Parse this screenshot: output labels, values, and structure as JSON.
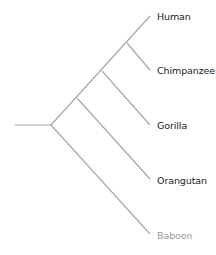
{
  "diagram": {
    "type": "phylogenetic-tree",
    "line_color": "#a8a8a8",
    "label_color": "#222222",
    "outgroup_label_color": "#9a9a9a",
    "taxa": [
      {
        "name": "Human",
        "tip": [
          150,
          16
        ]
      },
      {
        "name": "Chimpanzee",
        "tip": [
          150,
          70
        ]
      },
      {
        "name": "Gorilla",
        "tip": [
          150,
          125
        ]
      },
      {
        "name": "Orangutan",
        "tip": [
          150,
          179
        ]
      },
      {
        "name": "Baboon",
        "tip": [
          150,
          234
        ]
      }
    ]
  }
}
